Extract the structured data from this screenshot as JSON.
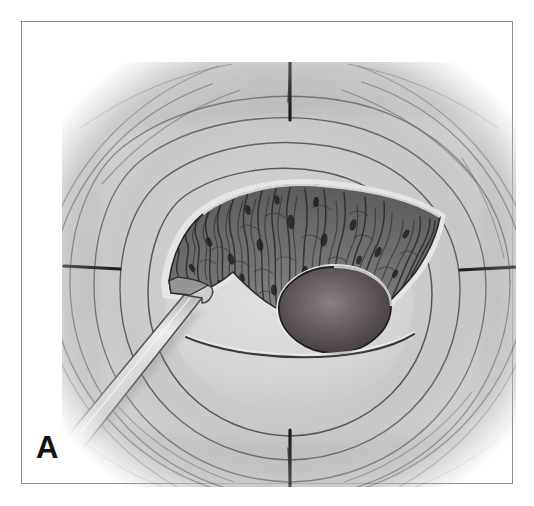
{
  "figure": {
    "panel_letter": "A",
    "title": "",
    "caption": "",
    "type": "medical-illustration",
    "rendering": "grayscale pencil / airbrush anatomical drawing",
    "palette": {
      "page_background": "#ffffff",
      "frame_border": "#8f9094",
      "tissue_light": "#dcdcdc",
      "tissue_mid": "#c6c6c6",
      "tissue_shadow": "#a8a8a8",
      "fold_line": "#4a4a4a",
      "flap_dark": "#6e6e6e",
      "flap_darkest": "#4c4c4c",
      "striation": "#2e2e2e",
      "ostium_dark": "#4a4446",
      "ostium_highlight": "#8a8286",
      "instrument_body": "#d2d2d2",
      "instrument_edge": "#5a5a5a",
      "label_text": "#111111"
    },
    "frame": {
      "left": 21,
      "top": 21,
      "width": 492,
      "height": 463,
      "border_width": 1
    },
    "canvas": {
      "left": 40,
      "top": 40,
      "width": 454,
      "height": 425,
      "edge_treatment": "soft vignette fading to white"
    },
    "elements": [
      {
        "name": "concentric-tissue-folds",
        "description": "Multiple nested, roughly rectangular-to-oval contour lines radiating outward from the central opening, suggesting rugose mucosal folds.",
        "ring_count": 7
      },
      {
        "name": "radial-cleft-marks",
        "description": "Four short dark radial marks at the cardinal points of the field (12, 3, 6 and 9 o'clock) where the folds converge.",
        "positions": [
          "top-center",
          "right-center",
          "bottom-center",
          "left-center"
        ]
      },
      {
        "name": "fan-shaped-flap",
        "description": "Dark fan/wedge shaped region of exposed textured tissue occupying the upper half of the central cavity, filled with fine radiating wavy striations and scattered dark punctate dots.",
        "span_degrees": 200
      },
      {
        "name": "central-ostium",
        "description": "Dark rounded-oval opening at the centre-bottom of the fan, shaded darkest at its rim with a softer lighter centre and a thin pale outline.",
        "shape": "oval"
      },
      {
        "name": "crescent-ridge",
        "description": "Thin shallow crescent line sweeping left to right beneath the ostium.",
        "shape": "arc"
      },
      {
        "name": "surgical-instrument",
        "description": "Long slender straight probe/retractor entering from the lower-left corner at roughly 45 degrees, its tip engaging and lifting the left edge of the fan-shaped flap.",
        "angle_degrees": 45,
        "entry_corner": "lower-left"
      }
    ]
  }
}
